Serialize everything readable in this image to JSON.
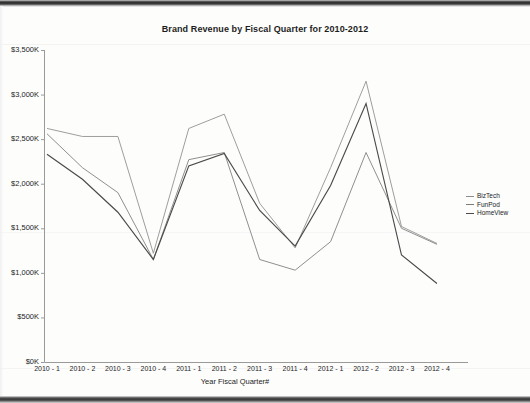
{
  "chart_data": {
    "type": "line",
    "title": "Brand Revenue by Fiscal Quarter for 2010-2012",
    "xlabel": "Year Fiscal Quarter#",
    "ylabel": "",
    "categories": [
      "2010 - 1",
      "2010 - 2",
      "2010 - 3",
      "2010 - 4",
      "2011 - 1",
      "2011 - 2",
      "2011 - 3",
      "2011 - 4",
      "2012 - 1",
      "2012 - 2",
      "2012 - 3",
      "2012 - 4"
    ],
    "ytick_labels": [
      "$3,500K",
      "$3,000K",
      "$2,500K",
      "$2,000K",
      "$1,500K",
      "$1,000K",
      "$500K",
      "$0K"
    ],
    "ytick_values": [
      3500,
      3000,
      2500,
      2000,
      1500,
      1000,
      500,
      0
    ],
    "ylim": [
      0,
      3500
    ],
    "yunit": "K",
    "grid": false,
    "legend_position": "right",
    "series": [
      {
        "name": "BizTech",
        "color": "#8d8d8d",
        "values": [
          2620,
          2530,
          2530,
          1220,
          2620,
          2780,
          1780,
          1280,
          2180,
          3150,
          1520,
          1330
        ]
      },
      {
        "name": "FunPod",
        "color": "#7b7b7b",
        "values": [
          2560,
          2180,
          1900,
          1150,
          2270,
          2350,
          1150,
          1030,
          1350,
          2350,
          1500,
          1320
        ]
      },
      {
        "name": "HomeView",
        "color": "#4a4a4a",
        "values": [
          2330,
          2050,
          1680,
          1150,
          2200,
          2340,
          1700,
          1300,
          1980,
          2900,
          1200,
          880
        ]
      }
    ]
  },
  "legend": {
    "items": [
      {
        "label": "BizTech"
      },
      {
        "label": "FunPod"
      },
      {
        "label": "HomeView"
      }
    ]
  }
}
